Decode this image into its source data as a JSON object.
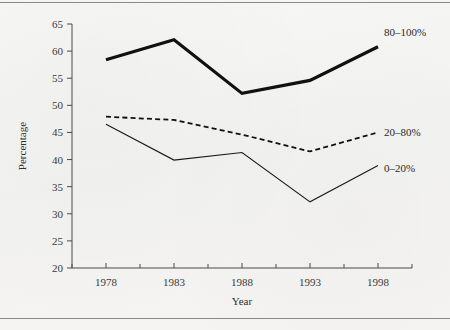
{
  "figure": {
    "background_color": "#f4f4f2",
    "rule_color": "#8a8a88",
    "ink_color": "#1a1a1a"
  },
  "chart_data": {
    "type": "line",
    "title": "",
    "subtitle": "",
    "xlabel": "Year",
    "ylabel": "Percentage",
    "x": [
      1978,
      1983,
      1988,
      1993,
      1998
    ],
    "xtick_labels": [
      "1978",
      "1983",
      "1988",
      "1993",
      "1998"
    ],
    "xlim": [
      1975.5,
      2000.5
    ],
    "ylim": [
      20,
      65
    ],
    "ytick_labels": [
      "20",
      "25",
      "30",
      "35",
      "40",
      "45",
      "50",
      "55",
      "60",
      "65"
    ],
    "yticks": [
      20,
      25,
      30,
      35,
      40,
      45,
      50,
      55,
      60,
      65
    ],
    "grid": false,
    "legend_position": "right-inline-end-of-line",
    "minor_xticks": true,
    "series": [
      {
        "name": "80–100%",
        "label": "80–100%",
        "style": "thick-solid",
        "stroke_width": 3.2,
        "dash": "",
        "color": "#111111",
        "values": [
          58.4,
          62.1,
          52.2,
          54.6,
          60.8
        ]
      },
      {
        "name": "20–80%",
        "label": "20–80%",
        "style": "dashed",
        "stroke_width": 1.8,
        "dash": "5,3.2",
        "color": "#111111",
        "values": [
          47.9,
          47.3,
          44.6,
          41.5,
          45.0
        ]
      },
      {
        "name": "0–20%",
        "label": "0–20%",
        "style": "thin-solid",
        "stroke_width": 1.1,
        "dash": "",
        "color": "#1a1a1a",
        "values": [
          46.5,
          39.9,
          41.3,
          32.2,
          38.9
        ]
      }
    ]
  }
}
